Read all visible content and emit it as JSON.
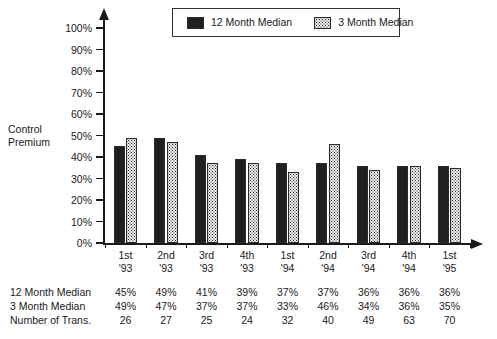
{
  "axis_title": "Control\nPremium",
  "legend": {
    "items": [
      {
        "label": "12 Month Median",
        "swatch": "solid-black-swatch"
      },
      {
        "label": "3 Month Median",
        "swatch": "dotted-pattern-swatch"
      }
    ]
  },
  "y_axis": {
    "ticks": [
      "0%",
      "10%",
      "20%",
      "30%",
      "40%",
      "50%",
      "60%",
      "70%",
      "80%",
      "90%",
      "100%"
    ]
  },
  "x_axis": {
    "groups": [
      {
        "line1": "1st",
        "line2": "'93"
      },
      {
        "line1": "2nd",
        "line2": "'93"
      },
      {
        "line1": "3rd",
        "line2": "'93"
      },
      {
        "line1": "4th",
        "line2": "'93"
      },
      {
        "line1": "1st",
        "line2": "'94"
      },
      {
        "line1": "2nd",
        "line2": "'94"
      },
      {
        "line1": "3rd",
        "line2": "'94"
      },
      {
        "line1": "4th",
        "line2": "'94"
      },
      {
        "line1": "1st",
        "line2": "'95"
      }
    ]
  },
  "table": {
    "rows": [
      {
        "label": "12 Month Median",
        "values": [
          "45%",
          "49%",
          "41%",
          "39%",
          "37%",
          "37%",
          "36%",
          "36%",
          "36%"
        ]
      },
      {
        "label": "3 Month Median",
        "values": [
          "49%",
          "47%",
          "37%",
          "37%",
          "33%",
          "46%",
          "34%",
          "36%",
          "35%"
        ]
      },
      {
        "label": "Number of Trans.",
        "values": [
          "26",
          "27",
          "25",
          "24",
          "32",
          "40",
          "49",
          "63",
          "70"
        ]
      }
    ]
  },
  "chart_data": {
    "type": "bar",
    "title": "",
    "xlabel": "",
    "ylabel": "Control Premium",
    "ylim": [
      0,
      100
    ],
    "ytick_step": 10,
    "grid": false,
    "legend_position": "top-center",
    "categories": [
      "1st '93",
      "2nd '93",
      "3rd '93",
      "4th '93",
      "1st '94",
      "2nd '94",
      "3rd '94",
      "4th '94",
      "1st '95"
    ],
    "series": [
      {
        "name": "12 Month Median",
        "fill": "solid",
        "color": "#231f20",
        "values": [
          45,
          49,
          41,
          39,
          37,
          37,
          36,
          36,
          36
        ]
      },
      {
        "name": "3 Month Median",
        "fill": "dotted",
        "color": "#8a8a8a",
        "values": [
          49,
          47,
          37,
          37,
          33,
          46,
          34,
          36,
          35
        ]
      }
    ],
    "annotations": {
      "number_of_transactions": [
        26,
        27,
        25,
        24,
        32,
        40,
        49,
        63,
        70
      ]
    }
  }
}
